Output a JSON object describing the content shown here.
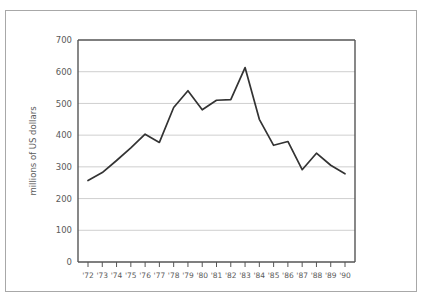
{
  "chart_data": {
    "type": "line",
    "title": "",
    "xlabel": "",
    "ylabel": "millions of US dollars",
    "x": [
      "'72",
      "'73",
      "'74",
      "'75",
      "'76",
      "'77",
      "'78",
      "'79",
      "'80",
      "'81",
      "'82",
      "'83",
      "'84",
      "'85",
      "'86",
      "'87",
      "'88",
      "'89",
      "'90"
    ],
    "categories": [
      "'72",
      "'73",
      "'74",
      "'75",
      "'76",
      "'77",
      "'78",
      "'79",
      "'80",
      "'81",
      "'82",
      "'83",
      "'84",
      "'85",
      "'86",
      "'87",
      "'88",
      "'89",
      "'90"
    ],
    "values": [
      257,
      282,
      320,
      360,
      403,
      377,
      487,
      540,
      480,
      510,
      512,
      613,
      450,
      368,
      380,
      291,
      343,
      305,
      278
    ],
    "series": [
      {
        "name": "millions of US dollars",
        "values": [
          257,
          282,
          320,
          360,
          403,
          377,
          487,
          540,
          480,
          510,
          512,
          613,
          450,
          368,
          380,
          291,
          343,
          305,
          278
        ]
      }
    ],
    "ylim": [
      0,
      700
    ],
    "ytick_values": [
      0,
      100,
      200,
      300,
      400,
      500,
      600,
      700
    ],
    "ytick_labels": [
      "0",
      "100",
      "200",
      "300",
      "400",
      "500",
      "600",
      "700"
    ],
    "grid": "horizontal",
    "legend": "none",
    "line_color": "#333333",
    "grid_color": "#cfcfcf",
    "axis_color": "#555555",
    "frame_color": "#a8a8a8",
    "background_color": "#ffffff"
  }
}
